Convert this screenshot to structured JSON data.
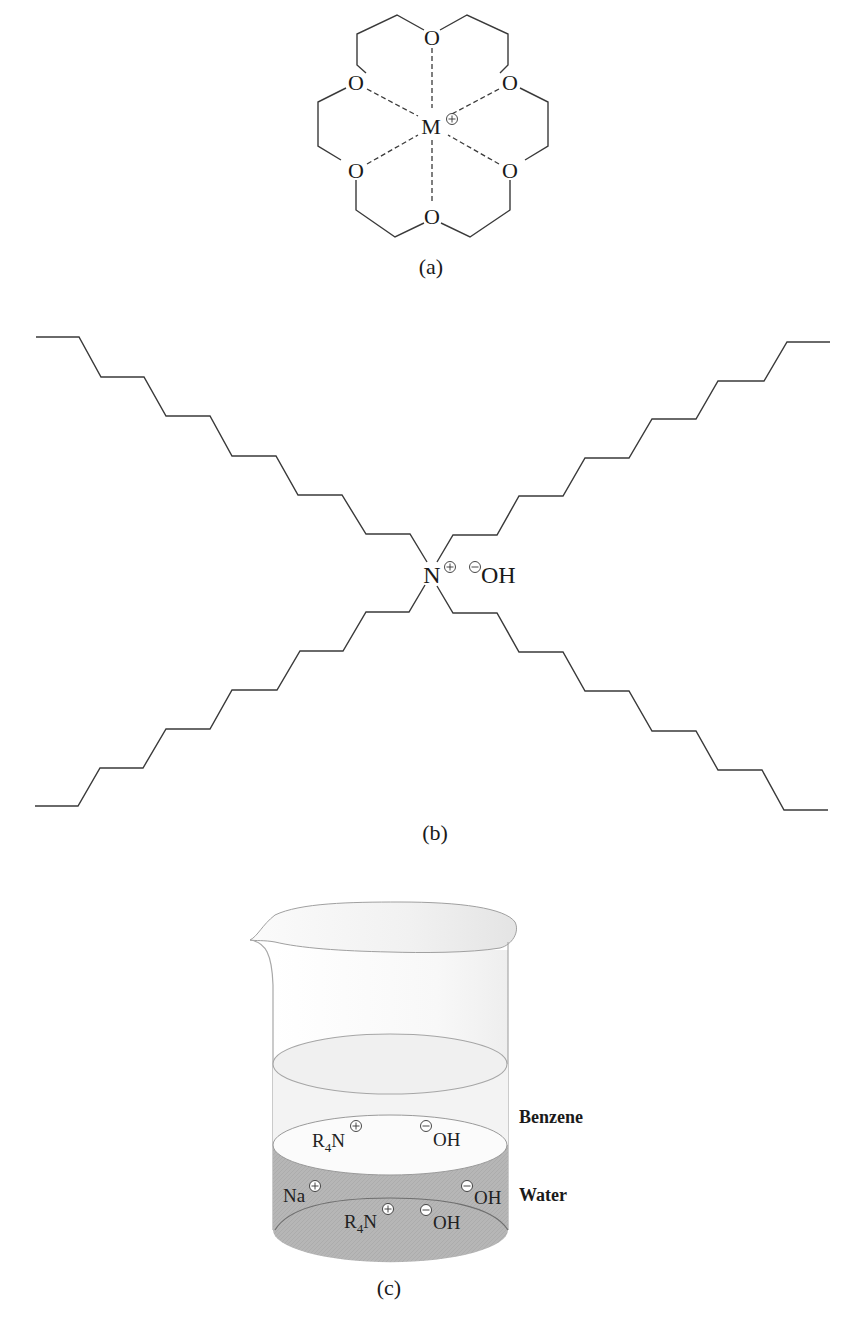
{
  "figure": {
    "panels": [
      {
        "id": "a",
        "caption": "(a)",
        "description": "18-crown-6 ether complexing a metal cation",
        "ring_oxygen_label": "O",
        "central_atom_label": "M",
        "central_atom_charge": "+",
        "oxygen_count": 6
      },
      {
        "id": "b",
        "caption": "(b)",
        "description": "Tetraalkylammonium hydroxide with four long alkyl chains",
        "cation_label": "N",
        "cation_charge": "+",
        "anion_label": "OH",
        "anion_charge": "-",
        "chain_count": 4
      },
      {
        "id": "c",
        "caption": "(c)",
        "description": "Beaker showing phase-transfer between benzene and water layers",
        "layers": [
          {
            "name": "Benzene",
            "color": "#f7f7f7"
          },
          {
            "name": "Water",
            "color": "#b4b4b4"
          }
        ],
        "benzene_species": [
          {
            "base": "R",
            "subscript": "4",
            "tail": "N",
            "charge": "+"
          },
          {
            "base": "OH",
            "charge": "-"
          }
        ],
        "water_species": [
          {
            "base": "Na",
            "charge": "+"
          },
          {
            "base": "OH",
            "charge": "-"
          },
          {
            "base": "R",
            "subscript": "4",
            "tail": "N",
            "charge": "+"
          },
          {
            "base": "OH",
            "charge": "-"
          }
        ]
      }
    ],
    "labels": {
      "caption_a": "(a)",
      "caption_b": "(b)",
      "caption_c": "(c)",
      "oxygen": "O",
      "metal": "M",
      "nitrogen": "N",
      "hydroxide": "OH",
      "sodium": "Na",
      "r_group": "R",
      "r_subscript": "4",
      "benzene": "Benzene",
      "water": "Water"
    },
    "colors": {
      "line": "#3a3a3a",
      "water_fill": "#b4b4b4",
      "water_fill_dark": "#a6a6a6",
      "benzene_fill": "#f6f6f6",
      "glass_stroke": "#a8a8a8"
    }
  }
}
